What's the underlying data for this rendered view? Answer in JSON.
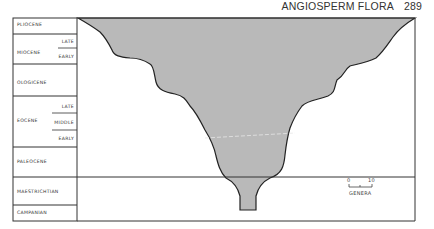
{
  "header": {
    "title": "ANGIOSPERM FLORA",
    "page_number": "289"
  },
  "periods": [
    {
      "name": "PLIOCENE",
      "subdivisions": []
    },
    {
      "name": "MIOCENE",
      "subdivisions": [
        "LATE",
        "EARLY"
      ]
    },
    {
      "name": "OLOGICENE",
      "subdivisions": []
    },
    {
      "name": "EOCENE",
      "subdivisions": [
        "LATE",
        "MIDDLE",
        "EARLY"
      ]
    },
    {
      "name": "PALEOCENE",
      "subdivisions": []
    },
    {
      "name": "MAESTRICHTIAN",
      "subdivisions": []
    },
    {
      "name": "CAMPANIAN",
      "subdivisions": []
    }
  ],
  "scale": {
    "min_label": "0",
    "max_label": "10",
    "unit_label": "GENERA"
  },
  "colors": {
    "fill": "#b9b9b9",
    "outline": "#222222",
    "grid": "#333333"
  }
}
